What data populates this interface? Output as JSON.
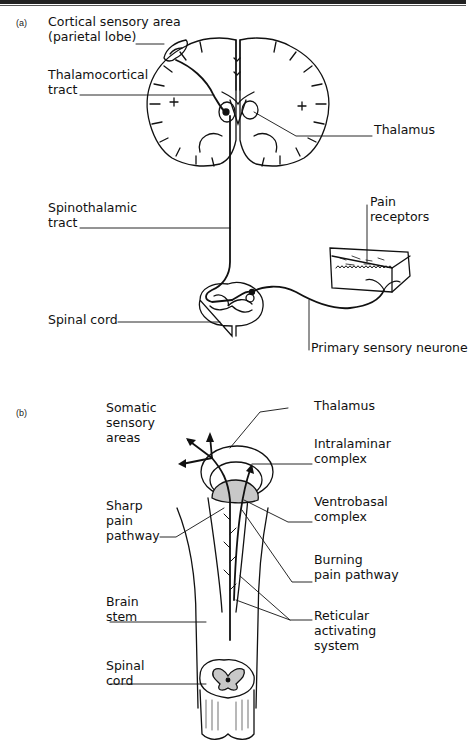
{
  "panel_a": {
    "tag": "(a)",
    "labels": {
      "cortical": "Cortical sensory area\n(parietal lobe)",
      "thalamocortical": "Thalamocortical\ntract",
      "thalamus": "Thalamus",
      "spinothalamic": "Spinothalamic\ntract",
      "pain_receptors": "Pain\nreceptors",
      "spinal_cord": "Spinal cord",
      "primary_neurone": "Primary sensory neurone"
    }
  },
  "panel_b": {
    "tag": "(b)",
    "labels": {
      "somatic": "Somatic\nsensory\nareas",
      "thalamus": "Thalamus",
      "intralaminar": "Intralaminar\ncomplex",
      "sharp": "Sharp\npain\npathway",
      "ventrobasal": "Ventrobasal\ncomplex",
      "burning": "Burning\npain pathway",
      "brain_stem": "Brain\nstem",
      "reticular": "Reticular\nactivating\nsystem",
      "spinal_cord": "Spinal\ncord"
    }
  },
  "colors": {
    "line": "#111111",
    "shade": "#c8c8c8"
  }
}
